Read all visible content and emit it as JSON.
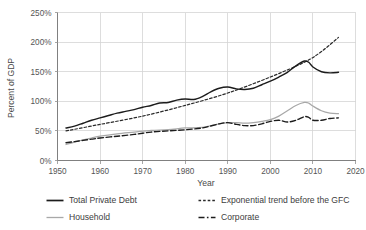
{
  "chart_data": {
    "type": "line",
    "title": "",
    "xlabel": "Year",
    "ylabel": "Percent of GDP",
    "xlim": [
      1950,
      2020
    ],
    "ylim": [
      0,
      250
    ],
    "grid": true,
    "legend_position": "bottom",
    "x_ticks": [
      "1950",
      "1960",
      "1970",
      "1980",
      "1990",
      "2000",
      "2010",
      "2020"
    ],
    "x_tick_values": [
      1950,
      1960,
      1970,
      1980,
      1990,
      2000,
      2010,
      2020
    ],
    "y_ticks": [
      "0%",
      "50%",
      "100%",
      "150%",
      "200%",
      "250%"
    ],
    "y_tick_values": [
      0,
      50,
      100,
      150,
      200,
      250
    ],
    "series": [
      {
        "name": "Total Private Debt",
        "style": "solid-black",
        "color": "#1c1c1c",
        "x": [
          1952,
          1954,
          1956,
          1958,
          1960,
          1962,
          1964,
          1966,
          1968,
          1970,
          1972,
          1974,
          1976,
          1978,
          1980,
          1982,
          1984,
          1986,
          1988,
          1990,
          1992,
          1994,
          1996,
          1998,
          2000,
          2002,
          2004,
          2006,
          2008,
          2009,
          2010,
          2012,
          2014,
          2016
        ],
        "values": [
          55,
          58,
          63,
          68,
          72,
          76,
          80,
          83,
          86,
          90,
          93,
          97,
          98,
          102,
          104,
          103,
          108,
          116,
          122,
          124,
          121,
          120,
          122,
          128,
          134,
          141,
          149,
          160,
          168,
          166,
          158,
          150,
          148,
          149
        ]
      },
      {
        "name": "Exponential trend before the GFC",
        "style": "dotted-dash",
        "color": "#2a2a2a",
        "x": [
          1952,
          1960,
          1970,
          1980,
          1990,
          2000,
          2008,
          2012,
          2016
        ],
        "values": [
          50,
          61,
          75,
          93,
          114,
          141,
          166,
          184,
          208
        ]
      },
      {
        "name": "Household",
        "style": "solid-grey",
        "color": "#a8a8a8",
        "x": [
          1952,
          1954,
          1956,
          1958,
          1960,
          1964,
          1968,
          1972,
          1976,
          1980,
          1984,
          1988,
          1990,
          1992,
          1994,
          1996,
          1998,
          2000,
          2002,
          2004,
          2006,
          2008,
          2009,
          2010,
          2012,
          2014,
          2016
        ],
        "values": [
          27,
          31,
          35,
          38,
          41,
          45,
          48,
          51,
          52,
          55,
          56,
          62,
          64,
          64,
          63,
          64,
          66,
          69,
          75,
          84,
          93,
          98,
          97,
          92,
          84,
          80,
          79
        ]
      },
      {
        "name": "Corporate",
        "style": "dashed-black",
        "color": "#1c1c1c",
        "x": [
          1952,
          1954,
          1956,
          1958,
          1960,
          1964,
          1968,
          1972,
          1976,
          1980,
          1984,
          1988,
          1990,
          1992,
          1994,
          1996,
          1998,
          2000,
          2002,
          2004,
          2006,
          2008,
          2009,
          2010,
          2012,
          2014,
          2016
        ],
        "values": [
          30,
          32,
          34,
          36,
          38,
          41,
          44,
          48,
          50,
          52,
          55,
          62,
          64,
          61,
          59,
          59,
          62,
          66,
          68,
          65,
          68,
          74,
          73,
          68,
          68,
          71,
          72
        ]
      }
    ]
  },
  "legend": {
    "items": [
      {
        "label": "Total Private Debt",
        "style": "solid-black"
      },
      {
        "label": "Exponential trend before the GFC",
        "style": "dotted-dash"
      },
      {
        "label": "Household",
        "style": "solid-grey"
      },
      {
        "label": "Corporate",
        "style": "dashed-black"
      }
    ]
  },
  "colors": {
    "total_private_debt": "#1c1c1c",
    "trend": "#2a2a2a",
    "household": "#a8a8a8",
    "corporate": "#1c1c1c",
    "grid": "#d4d4d4",
    "axis": "#808080",
    "text": "#4a4a4a",
    "background": "#ffffff"
  }
}
